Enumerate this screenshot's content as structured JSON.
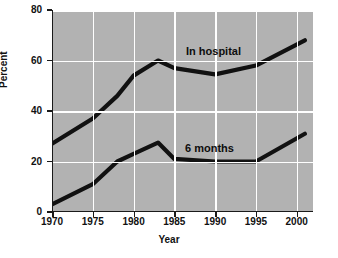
{
  "chart_data": {
    "type": "line",
    "title": "",
    "xlabel": "Year",
    "ylabel": "Percent",
    "xlim": [
      1970,
      2002
    ],
    "ylim": [
      0,
      80
    ],
    "grid": true,
    "legend_position": "inline-annotation",
    "xticks": [
      1970,
      1975,
      1980,
      1985,
      1990,
      1995,
      2000
    ],
    "xticklabels": [
      "1970",
      "1975",
      "1980",
      "1985",
      "1990",
      "1995",
      "2000"
    ],
    "yticks": [
      0,
      20,
      40,
      60,
      80
    ],
    "yticklabels": [
      "0",
      "20",
      "40",
      "60",
      "80"
    ],
    "series": [
      {
        "name": "In hospital",
        "color": "#111111",
        "x": [
          1970,
          1975,
          1978,
          1980,
          1983,
          1985,
          1990,
          1995,
          2001
        ],
        "values": [
          27,
          37,
          46,
          54,
          60,
          57,
          54.5,
          58,
          68
        ]
      },
      {
        "name": "6 months",
        "color": "#111111",
        "x": [
          1970,
          1975,
          1978,
          1980,
          1983,
          1985,
          1990,
          1995,
          2001
        ],
        "values": [
          3,
          11,
          20,
          23,
          27.5,
          21,
          20,
          20,
          31
        ]
      }
    ],
    "annotations": [
      {
        "text": "In hospital",
        "series": "In hospital"
      },
      {
        "text": "6 months",
        "series": "6 months"
      }
    ],
    "colors": {
      "plot_background": "#b2b2b2",
      "gridlines": "#ffffff",
      "axis": "#1a1a1a",
      "line": "#111111",
      "page_background": "#ffffff"
    }
  }
}
